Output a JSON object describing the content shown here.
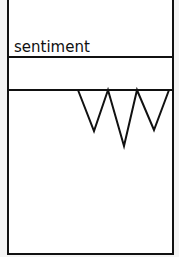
{
  "diagram": {
    "label": "sentiment",
    "triangles": 3
  }
}
